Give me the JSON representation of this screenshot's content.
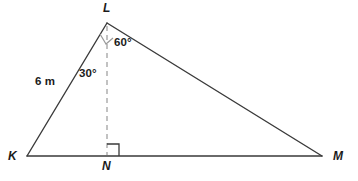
{
  "figure": {
    "kind": "geometry-diagram",
    "shape": "triangle-with-altitude",
    "background_color": "#ffffff",
    "stroke_color": "#3a3a3a",
    "dashed_stroke_color": "#9a9a9a",
    "text_color": "#1b1b1b",
    "vertices": {
      "K": {
        "label": "K",
        "x": 27,
        "y": 156
      },
      "L": {
        "label": "L",
        "x": 107,
        "y": 23
      },
      "M": {
        "label": "M",
        "x": 322,
        "y": 156
      },
      "N": {
        "label": "N",
        "x": 107,
        "y": 156
      }
    },
    "segments": [
      {
        "name": "KL",
        "from": "K",
        "to": "L",
        "style": "solid"
      },
      {
        "name": "LM",
        "from": "L",
        "to": "M",
        "style": "solid"
      },
      {
        "name": "KM",
        "from": "K",
        "to": "M",
        "style": "solid"
      },
      {
        "name": "LN",
        "from": "L",
        "to": "N",
        "style": "dashed"
      }
    ],
    "side_labels": [
      {
        "name": "KL",
        "text": "6 m",
        "value": 6,
        "unit": "m"
      }
    ],
    "angle_labels": [
      {
        "name": "KLN",
        "text": "30°",
        "value": 30,
        "unit": "degrees",
        "at": "L"
      },
      {
        "name": "NLM",
        "text": "60°",
        "value": 60,
        "unit": "degrees",
        "at": "L"
      }
    ],
    "right_angles": [
      {
        "name": "LNK",
        "at": "N",
        "marker": "square"
      }
    ],
    "angle_arc_markers": [
      {
        "name": "KLN-marker",
        "at": "L",
        "marker": "square"
      }
    ]
  }
}
